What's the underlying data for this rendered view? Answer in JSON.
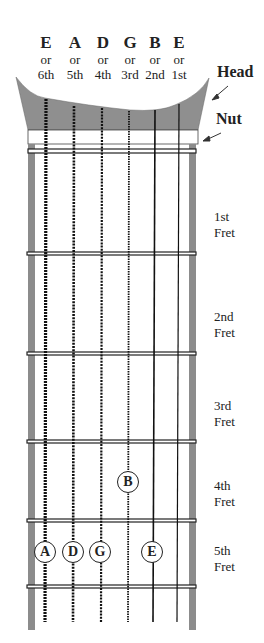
{
  "strings": [
    {
      "name": "E",
      "or": "or",
      "number": "6th",
      "x": 46
    },
    {
      "name": "A",
      "or": "or",
      "number": "5th",
      "x": 74
    },
    {
      "name": "D",
      "or": "or",
      "number": "4th",
      "x": 102
    },
    {
      "name": "G",
      "or": "or",
      "number": "3rd",
      "x": 129
    },
    {
      "name": "B",
      "or": "or",
      "number": "2nd",
      "x": 155
    },
    {
      "name": "E",
      "or": "or",
      "number": "1st",
      "x": 179
    }
  ],
  "labels": {
    "head": "Head",
    "nut": "Nut"
  },
  "frets": [
    {
      "line1": "1st",
      "line2": "Fret"
    },
    {
      "line1": "2nd",
      "line2": "Fret"
    },
    {
      "line1": "3rd",
      "line2": "Fret"
    },
    {
      "line1": "4th",
      "line2": "Fret"
    },
    {
      "line1": "5th",
      "line2": "Fret"
    }
  ],
  "notes": [
    {
      "label": "B",
      "string": "3rd",
      "fret": "4th"
    },
    {
      "label": "A",
      "string": "6th",
      "fret": "5th"
    },
    {
      "label": "D",
      "string": "5th",
      "fret": "5th"
    },
    {
      "label": "G",
      "string": "4th",
      "fret": "5th"
    },
    {
      "label": "E",
      "string": "2nd",
      "fret": "5th"
    }
  ],
  "colors": {
    "head": "#8f8f8f",
    "rail": "#8c8c8c",
    "line": "#222222"
  }
}
